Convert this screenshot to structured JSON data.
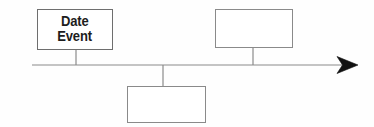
{
  "diagram": {
    "type": "timeline",
    "background_color": "#fefefe",
    "line_color": "#8a8a8a",
    "box_border_color": "#8a8a8a",
    "text_color": "#1d1d1d",
    "arrow_color": "#111111",
    "axis": {
      "name": "timeline-axis",
      "start_x": 32,
      "end_x": 345,
      "y": 65,
      "arrow_tip_x": 358,
      "direction": "right"
    },
    "boxes": [
      {
        "id": "box-date-event",
        "position": "above",
        "lines": [
          "Date",
          "Event"
        ],
        "line1": "Date",
        "line2": "Event",
        "x": 37,
        "y": 9,
        "width": 76,
        "height": 41,
        "connector_x": 76,
        "connector_from_y": 50,
        "connector_to_y": 65
      },
      {
        "id": "box-top-right",
        "position": "above",
        "lines": [],
        "x": 215,
        "y": 9,
        "width": 78,
        "height": 39,
        "connector_x": 253,
        "connector_from_y": 48,
        "connector_to_y": 65
      },
      {
        "id": "box-bottom-middle",
        "position": "below",
        "lines": [],
        "x": 127,
        "y": 86,
        "width": 79,
        "height": 37,
        "connector_x": 163,
        "connector_from_y": 65,
        "connector_to_y": 86
      }
    ]
  }
}
